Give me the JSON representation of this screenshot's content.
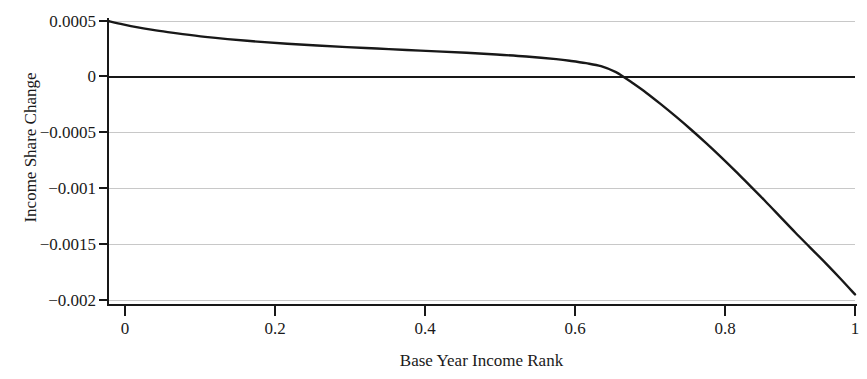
{
  "chart_data": {
    "type": "line",
    "title": "",
    "xlabel": "Base Year Income Rank",
    "ylabel": "Income Share Change",
    "xlim": [
      0,
      1
    ],
    "ylim": [
      -0.002,
      0.0005
    ],
    "grid": true,
    "legend": null,
    "zero_reference_line": 0,
    "x_ticks": [
      0,
      0.2,
      0.4,
      0.6,
      0.8,
      1
    ],
    "x_tick_labels": [
      "0",
      "0.2",
      "0.4",
      "0.6",
      "0.8",
      "1"
    ],
    "y_ticks": [
      0.0005,
      0,
      -0.0005,
      -0.001,
      -0.0015,
      -0.002
    ],
    "y_tick_labels": [
      "0.0005",
      "0",
      "−0.0005",
      "−0.001",
      "−0.0015",
      "−0.002"
    ],
    "series": [
      {
        "name": "Income Share Change",
        "color": "#181818",
        "x": [
          0.0,
          0.02,
          0.04,
          0.06,
          0.08,
          0.1,
          0.13,
          0.16,
          0.2,
          0.24,
          0.28,
          0.32,
          0.36,
          0.4,
          0.44,
          0.48,
          0.52,
          0.56,
          0.6,
          0.62,
          0.64,
          0.66,
          0.68,
          0.69,
          0.7,
          0.72,
          0.74,
          0.76,
          0.78,
          0.8,
          0.82,
          0.84,
          0.86,
          0.88,
          0.9,
          0.92,
          0.94,
          0.96,
          0.98,
          1.0
        ],
        "y": [
          0.0005,
          0.00047,
          0.000443,
          0.00042,
          0.0004,
          0.000382,
          0.000358,
          0.000338,
          0.000315,
          0.000296,
          0.00028,
          0.000266,
          0.000253,
          0.00024,
          0.000228,
          0.000215,
          0.0002,
          0.000182,
          0.000158,
          0.000142,
          0.000122,
          9.5e-05,
          4.2e-05,
          0.0,
          -4.5e-05,
          -0.00014,
          -0.000245,
          -0.000355,
          -0.00047,
          -0.00059,
          -0.000715,
          -0.000845,
          -0.00098,
          -0.001115,
          -0.001255,
          -0.001395,
          -0.00153,
          -0.001665,
          -0.001805,
          -0.00195
        ]
      }
    ],
    "notes": {
      "curve_start_value": 0.0005,
      "curve_end_value": -0.00195,
      "zero_crossing_x": 0.69
    }
  },
  "axes": {
    "y_label": "Income Share Change",
    "x_label": "Base Year Income Rank",
    "y_labels": {
      "t0": "0.0005",
      "t1": "0",
      "t2": "−0.0005",
      "t3": "−0.001",
      "t4": "−0.0015",
      "t5": "−0.002"
    },
    "x_labels": {
      "t0": "0",
      "t1": "0.2",
      "t2": "0.4",
      "t3": "0.6",
      "t4": "0.8",
      "t5": "1"
    }
  },
  "colors": {
    "curve": "#181818",
    "grid": "#c8c8c8",
    "axis": "#181818",
    "background": "#ffffff",
    "text": "#1a1a1a"
  }
}
